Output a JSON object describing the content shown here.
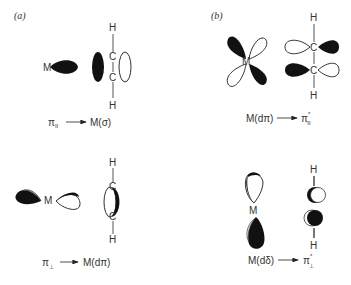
{
  "panels": {
    "a": {
      "label": "(a)",
      "top": {
        "metal": "M",
        "carbon_top": "C",
        "carbon_bottom": "C",
        "h_top": "H",
        "h_bottom": "H",
        "caption_left": "π",
        "caption_left_sub": "II",
        "caption_right": "M(σ)"
      },
      "bottom": {
        "metal": "M",
        "carbon_top": "C",
        "carbon_bottom": "C",
        "h_top": "H",
        "h_bottom": "H",
        "caption_left": "π",
        "caption_left_sub": "⊥",
        "caption_right": "M(dπ)"
      }
    },
    "b": {
      "label": "(b)",
      "top": {
        "metal": "M",
        "carbon_top": "C",
        "carbon_bottom": "C",
        "h_top": "H",
        "h_bottom": "H",
        "caption_left": "M(dπ)",
        "caption_right": "π",
        "caption_right_sup": "*",
        "caption_right_sub": "II"
      },
      "bottom": {
        "metal": "M",
        "h_top": "H",
        "h_bottom": "H",
        "caption_left": "M(dδ)",
        "caption_right": "π",
        "caption_right_sup": "*",
        "caption_right_sub": "⊥"
      }
    }
  },
  "colors": {
    "filled_lobe": "#111111",
    "outline": "#333333",
    "background": "#ffffff"
  }
}
